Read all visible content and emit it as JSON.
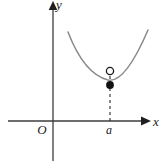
{
  "figure": {
    "background_color": "#ffffff",
    "width": 167,
    "height": 167
  },
  "axes": {
    "x_axis": {
      "label": "x",
      "color": "#3d3d3d",
      "y_position": 121,
      "x_start": 8,
      "x_end": 148,
      "has_arrow": true,
      "arrow_direction": "right"
    },
    "y_axis": {
      "label": "y",
      "color": "#3d3d3d",
      "x_position": 53,
      "y_start": 5,
      "y_end": 161,
      "has_arrow": true,
      "arrow_direction": "up"
    },
    "origin": {
      "label": "O",
      "x": 42,
      "y": 133
    }
  },
  "curve": {
    "color": "#8a8a8a",
    "stroke_width": 1.4,
    "shape": "parabola-like upward opening",
    "path": "M 68,32 C 78,58 92,76 108,80 C 122,83 136,58 148,30",
    "left_endpoint": [
      68,
      32
    ],
    "right_endpoint": [
      148,
      30
    ],
    "vertex_approx": [
      112,
      81
    ]
  },
  "points": {
    "open_circle": {
      "name": "removable-discontinuity-hole",
      "x": 110,
      "y": 71,
      "radius": 3.6,
      "fill": "#ffffff",
      "stroke": "#1a1a1a",
      "description": "hollow dot marking the limit value not attained"
    },
    "filled_dot": {
      "name": "function-value-point",
      "x": 110,
      "y": 85,
      "radius": 3.8,
      "fill": "#111111",
      "description": "solid dot marking the actual function value at x = a"
    }
  },
  "dashed_line": {
    "color": "#2a2a2a",
    "x": 110,
    "y_top": 71,
    "y_bottom": 121,
    "dash_pattern": "3,3",
    "stroke_width": 1.1
  },
  "tick_label": {
    "text": "a",
    "x": 107,
    "y": 133
  }
}
